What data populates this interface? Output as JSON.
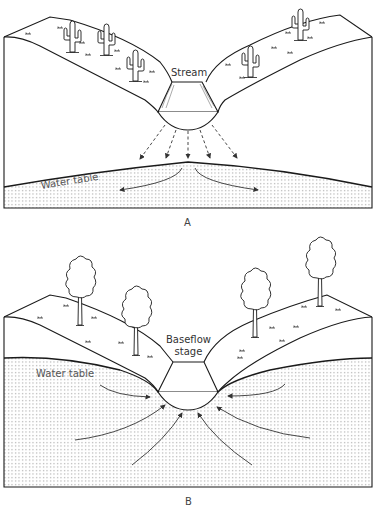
{
  "figure": {
    "panels": [
      {
        "id": "A",
        "label": "A",
        "setting": "arid (desert with saguaro cacti)",
        "stream_label": "Stream",
        "water_table_label": "Water table",
        "flow_direction": "losing stream: water seeps downward from stream to water table (dashed arrows), then spreads laterally"
      },
      {
        "id": "B",
        "label": "B",
        "setting": "humid (deciduous trees)",
        "stream_label_line1": "Baseflow",
        "stream_label_line2": "stage",
        "water_table_label": "Water table",
        "flow_direction": "gaining stream: groundwater flows toward and into the stream channel (curved arrows)"
      }
    ]
  },
  "colors": {
    "line": "#1a1a1a",
    "stipple": "#9a9a9a",
    "arrow": "#444444",
    "text": "#333333",
    "background": "#ffffff"
  }
}
